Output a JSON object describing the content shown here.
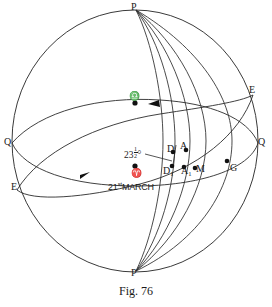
{
  "figure": {
    "caption": "Fig. 76",
    "caption_y": 286
  },
  "labels": {
    "pole_north": "P",
    "pole_south": "P",
    "equator_left": "Q",
    "equator_right": "Q",
    "ecliptic_left": "E",
    "ecliptic_right": "E",
    "point_G": "G",
    "point_D": "D",
    "point_A": "A",
    "point_D1": "D",
    "point_D1_sub": "1",
    "point_A1": "A",
    "point_A1_sub": "1",
    "point_M": "M",
    "aries_symbol": "♈",
    "libra_symbol": "♎",
    "date_text": "21",
    "date_sup": "st",
    "date_month": "MARCH",
    "obliquity_whole": "23",
    "obliquity_num": "1",
    "obliquity_den": "2",
    "obliquity_deg": "°"
  },
  "colors": {
    "ink": "#1a1a1a",
    "curve": "#2b2b2b",
    "outline": "#3a3a3a",
    "background": "#ffffff"
  },
  "label_positions": {
    "pole_north": {
      "x": 131,
      "y": 2
    },
    "pole_south": {
      "x": 131,
      "y": 268
    },
    "equator_left": {
      "x": 4,
      "y": 137
    },
    "equator_right": {
      "x": 258,
      "y": 137
    },
    "ecliptic_left": {
      "x": 11,
      "y": 182
    },
    "ecliptic_right": {
      "x": 249,
      "y": 85
    },
    "point_G": {
      "x": 230,
      "y": 163
    },
    "point_D": {
      "x": 167,
      "y": 146
    },
    "point_A": {
      "x": 179,
      "y": 143
    },
    "point_D1": {
      "x": 164,
      "y": 165
    },
    "point_A1": {
      "x": 182,
      "y": 165
    },
    "point_M": {
      "x": 196,
      "y": 164
    },
    "aries_symbol": {
      "x": 131,
      "y": 169
    },
    "libra_symbol": {
      "x": 129,
      "y": 93
    },
    "date": {
      "x": 110,
      "y": 180
    },
    "obliquity": {
      "x": 127,
      "y": 148
    }
  },
  "geometry": {
    "sphere": {
      "cx": 135,
      "cy": 140,
      "rx": 123,
      "ry": 132
    },
    "poles": {
      "north": {
        "x": 136,
        "y": 10
      },
      "south": {
        "x": 136,
        "y": 271
      }
    },
    "equator": {
      "left_x": 12,
      "right_x": 258,
      "y": 143,
      "bulge": 30
    },
    "ecliptic": {
      "left": {
        "x": 17,
        "y": 190
      },
      "right": {
        "x": 253,
        "y": 95
      }
    },
    "obliquity_degrees": 23.5,
    "meridian_count": 5,
    "marked_points": [
      {
        "name": "D",
        "x": 173,
        "y": 152
      },
      {
        "name": "A",
        "x": 186,
        "y": 150
      },
      {
        "name": "D1",
        "x": 172,
        "y": 166
      },
      {
        "name": "A1",
        "x": 184,
        "y": 167
      },
      {
        "name": "M",
        "x": 195,
        "y": 168
      },
      {
        "name": "G",
        "x": 227,
        "y": 161
      },
      {
        "name": "aries",
        "x": 135,
        "y": 166
      },
      {
        "name": "libra",
        "x": 135,
        "y": 103
      }
    ]
  }
}
